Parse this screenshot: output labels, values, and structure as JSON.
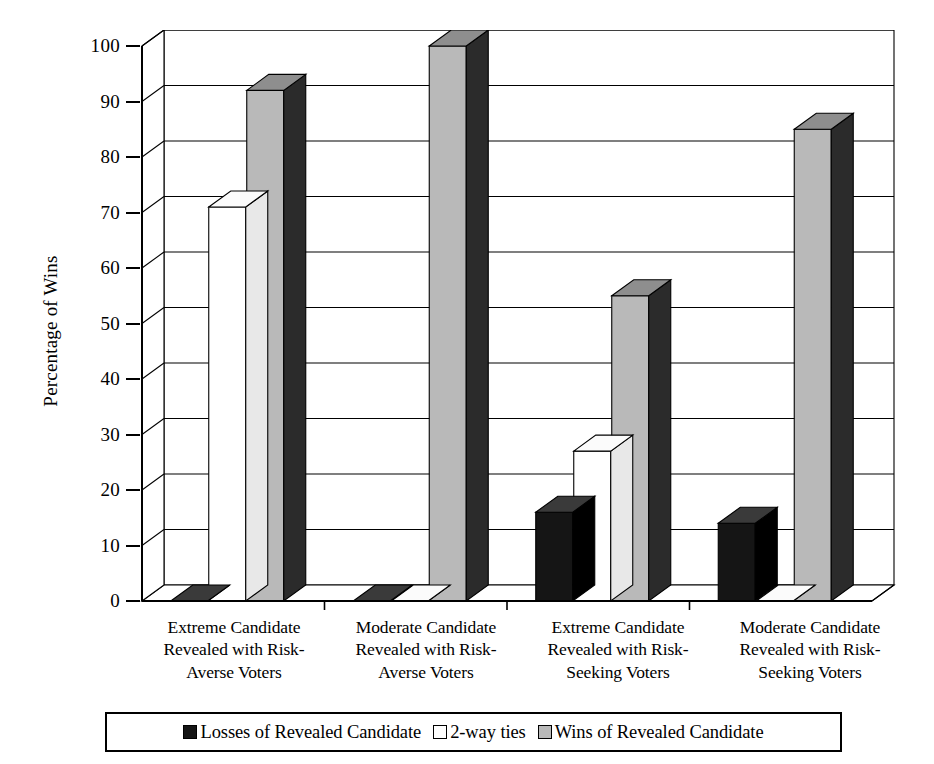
{
  "chart_data": {
    "type": "bar",
    "title": "",
    "xlabel": "",
    "ylabel": "Percentage of Wins",
    "ylim": [
      0,
      100
    ],
    "ytick_step": 10,
    "yticks": [
      0,
      10,
      20,
      30,
      40,
      50,
      60,
      70,
      80,
      90,
      100
    ],
    "grid": true,
    "grid_axis": "y",
    "style": "3d-bar",
    "legend_position": "bottom",
    "categories": [
      "Extreme Candidate Revealed with Risk-Averse Voters",
      "Moderate Candidate Revealed with Risk-Averse Voters",
      "Extreme Candidate Revealed with Risk-Seeking Voters",
      "Moderate Candidate Revealed with Risk-Seeking Voters"
    ],
    "category_lines": [
      [
        "Extreme Candidate",
        "Revealed with Risk-",
        "Averse Voters"
      ],
      [
        "Moderate Candidate",
        "Revealed with Risk-",
        "Averse Voters"
      ],
      [
        "Extreme Candidate",
        "Revealed with Risk-",
        "Seeking Voters"
      ],
      [
        "Moderate Candidate",
        "Revealed with Risk-",
        "Seeking Voters"
      ]
    ],
    "series": [
      {
        "name": "Losses of Revealed Candidate",
        "color": "#151515",
        "values": [
          0,
          0,
          16,
          14
        ]
      },
      {
        "name": "2-way ties",
        "color": "#ffffff",
        "values": [
          71,
          0,
          27,
          0
        ]
      },
      {
        "name": "Wins of Revealed Candidate",
        "color": "#b9b9b9",
        "values": [
          92,
          100,
          55,
          85
        ]
      }
    ]
  },
  "axis": {
    "y_title": "Percentage of Wins",
    "tick_labels": [
      "100",
      "90",
      "80",
      "70",
      "60",
      "50",
      "40",
      "30",
      "20",
      "10",
      "0"
    ]
  },
  "legend": {
    "items": [
      {
        "label": "Losses of Revealed Candidate",
        "swatch": "losses"
      },
      {
        "label": "2-way ties",
        "swatch": "ties"
      },
      {
        "label": "Wins of Revealed Candidate",
        "swatch": "wins"
      }
    ]
  },
  "colors": {
    "losses_front": "#151515",
    "losses_side": "#000000",
    "losses_top": "#3a3a3a",
    "ties_front": "#ffffff",
    "ties_side": "#e8e8e8",
    "ties_top": "#fbfbfb",
    "wins_front": "#b9b9b9",
    "wins_side": "#2b2b2b",
    "wins_top": "#8e8e8e",
    "axis": "#000000",
    "grid": "#000000"
  }
}
